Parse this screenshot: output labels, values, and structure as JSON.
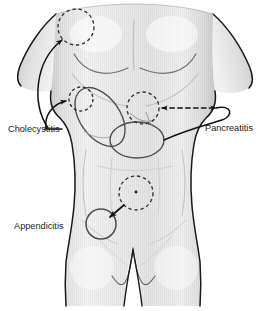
{
  "figure": {
    "view": "anterior torso, shoulders to upper thighs",
    "background_color": "#ffffff",
    "body_fill_color": "#ededed",
    "body_shade_color": "#d2d2d2",
    "outline_color": "#1a1a1a",
    "organ_outline_color": "#4d4d4d",
    "faint_contour_color": "#b9b9b9",
    "marker_color": "#333333"
  },
  "labels": [
    {
      "id": "cholecystitis",
      "text": "Cholecystitis",
      "x": 8,
      "y": 132,
      "anchor": "start",
      "pointer_style": "solid-curved-leader",
      "pointer_count": 2,
      "targets": [
        "right-shoulder-tip-region",
        "right-upper-quadrant-region"
      ]
    },
    {
      "id": "pancreatitis",
      "text": "Pancreatitis",
      "x": 205,
      "y": 131,
      "anchor": "start",
      "pointer_style": "dashed-double-headed-arrow-plus-solid-leader",
      "pointer_count": 2,
      "targets": [
        "epigastric-region",
        "stomach-outline"
      ]
    },
    {
      "id": "appendicitis",
      "text": "Appendicitis",
      "x": 14,
      "y": 229,
      "anchor": "start",
      "pointer_style": "solid-arrow",
      "pointer_count": 1,
      "targets": [
        "right-lower-quadrant-region"
      ]
    }
  ],
  "pain_regions": [
    {
      "id": "right-shoulder-tip-region",
      "label_for": "cholecystitis",
      "shape": "dashed-circle",
      "cx": 76,
      "cy": 27,
      "r": 18,
      "description": "referred pain at right shoulder / subscapular area"
    },
    {
      "id": "right-upper-quadrant-region",
      "label_for": "cholecystitis",
      "shape": "dashed-circle",
      "cx": 81,
      "cy": 99,
      "r": 12,
      "description": "local gallbladder pain, right upper quadrant"
    },
    {
      "id": "epigastric-region",
      "label_for": "pancreatitis",
      "shape": "dashed-circle",
      "cx": 143,
      "cy": 108,
      "r": 16,
      "description": "epigastric pain radiating to back"
    },
    {
      "id": "umbilical-region",
      "label_for": "appendicitis",
      "shape": "dashed-circle-with-center-dot",
      "cx": 136,
      "cy": 193,
      "r": 17,
      "description": "early periumbilical pain"
    },
    {
      "id": "right-lower-quadrant-region",
      "label_for": "appendicitis",
      "shape": "solid-circle",
      "cx": 101,
      "cy": 224,
      "r": 15,
      "description": "migrated pain at McBurney's point, right lower quadrant"
    }
  ],
  "organ_outlines": [
    {
      "id": "liver-outline",
      "shape": "tilted-ellipse",
      "cx": 100,
      "cy": 117,
      "rx": 20,
      "ry": 33,
      "rotation_deg": -35
    },
    {
      "id": "stomach-outline",
      "shape": "ellipse",
      "cx": 137,
      "cy": 140,
      "rx": 27,
      "ry": 18,
      "rotation_deg": 0
    }
  ]
}
